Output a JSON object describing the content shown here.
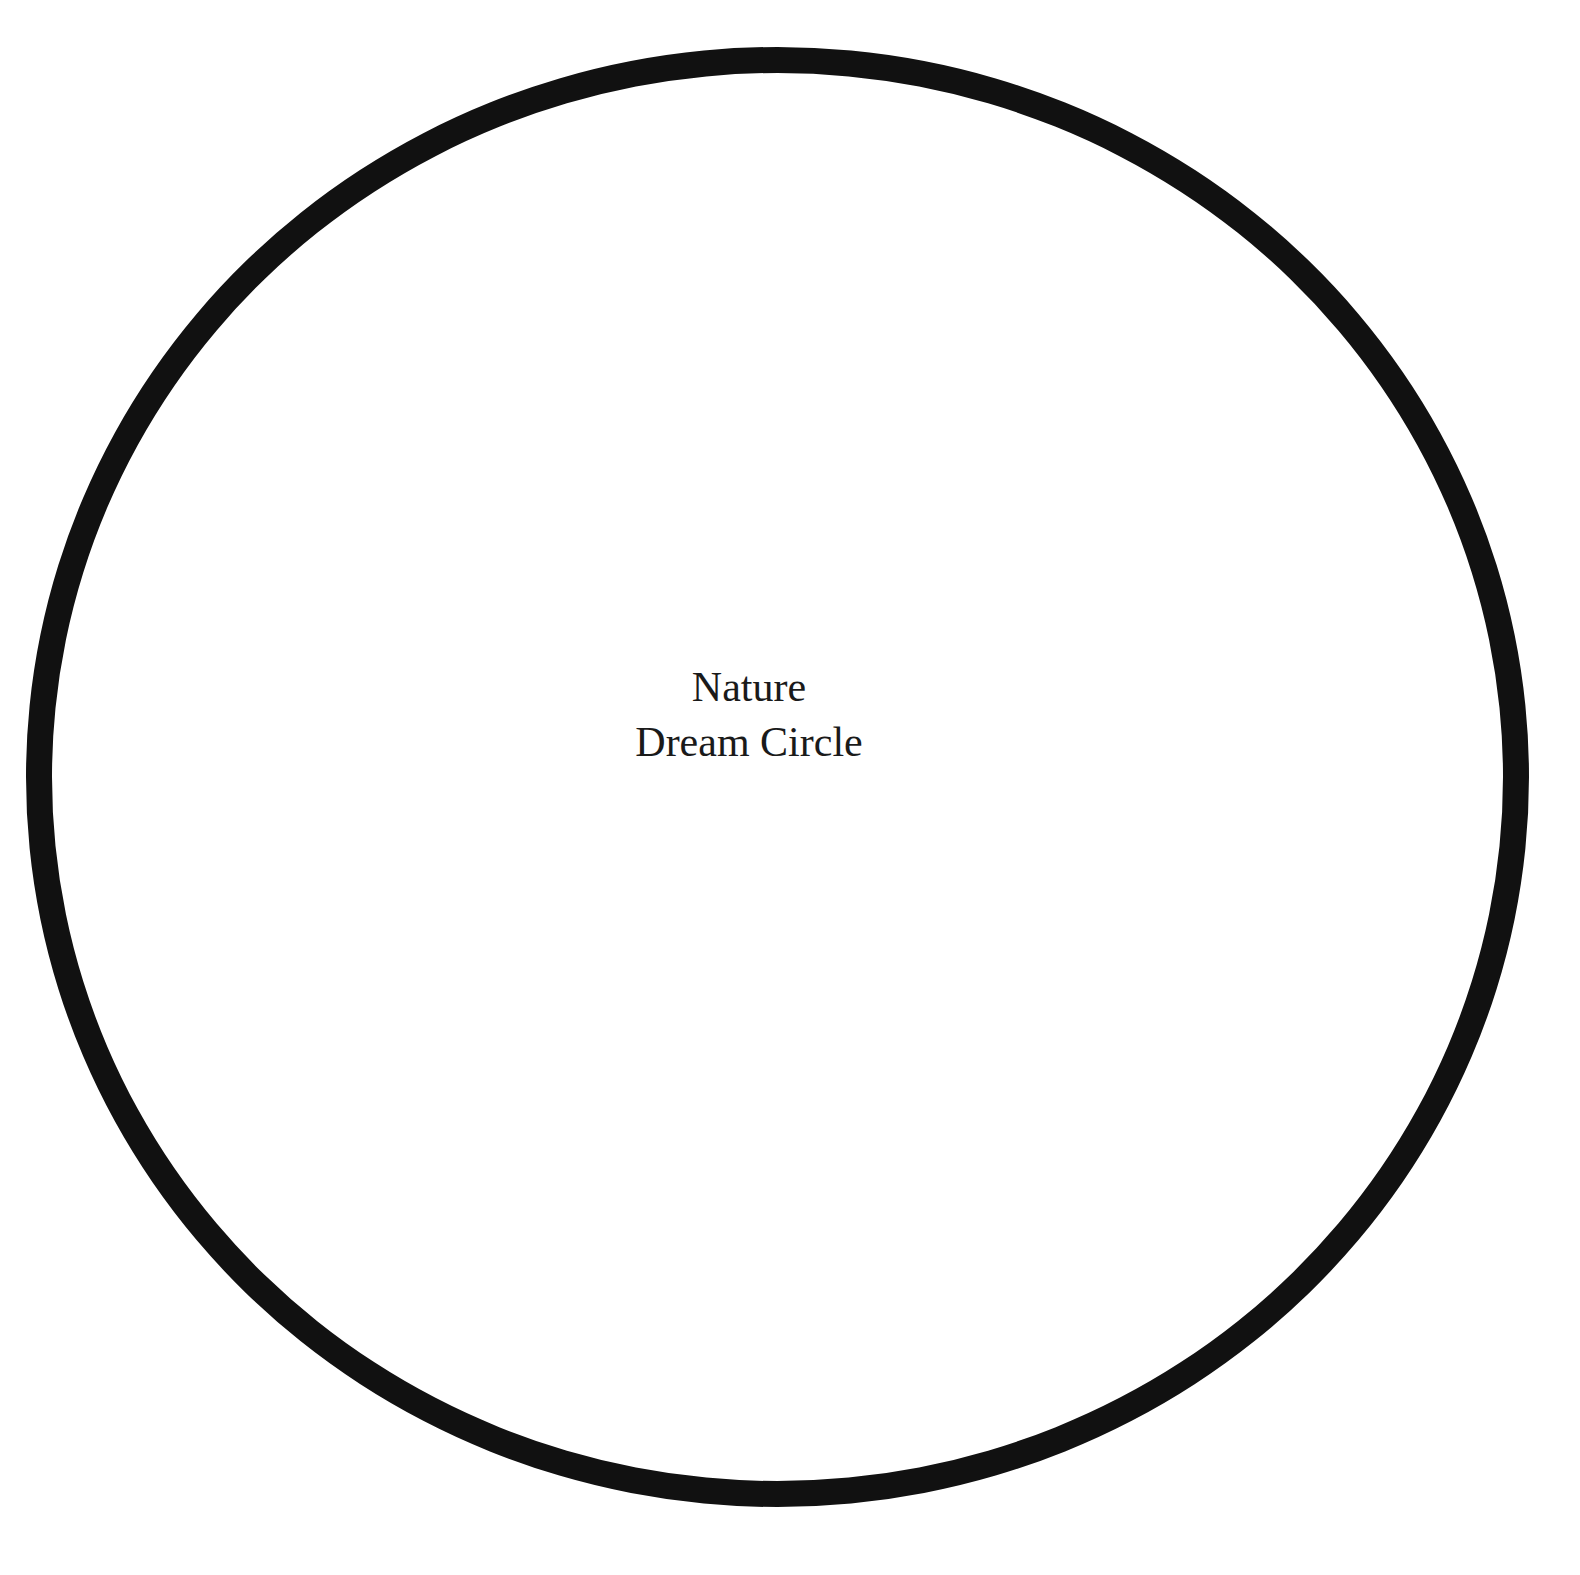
{
  "circle": {
    "stroke_color": "#111111",
    "background_color": "#ffffff"
  },
  "label": {
    "line1": "Nature",
    "line2": "Dream Circle"
  }
}
